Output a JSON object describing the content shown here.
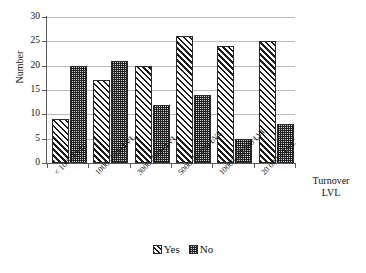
{
  "chart_data": {
    "type": "bar",
    "title": "",
    "subtitle": "",
    "xlabel": "Turnover LVL",
    "xlabel_lines": [
      "Turnover",
      "LVL"
    ],
    "ylabel": "Number",
    "ylim": [
      0,
      30
    ],
    "ytick_step": 5,
    "yticks": [
      0,
      5,
      10,
      15,
      20,
      25,
      30
    ],
    "ytick_labels": [
      "0",
      "5",
      "10",
      "15",
      "20",
      "25",
      "30"
    ],
    "grid": true,
    "grid_axis": "y",
    "legend_position": "bottom",
    "categories": [
      "< 1000 LVL",
      "1000–3000 LVL",
      "3000–5000 LVL",
      "5000–10 000 LVL",
      "10000–20 000 LVL",
      "20 000 < LVL"
    ],
    "series": [
      {
        "name": "Yes",
        "pattern": "diagonal-hatch",
        "values": [
          9,
          17,
          20,
          26,
          24,
          25
        ]
      },
      {
        "name": "No",
        "pattern": "checkerboard",
        "values": [
          20,
          21,
          12,
          14,
          5,
          8
        ]
      }
    ]
  },
  "legend": {
    "items": [
      {
        "label": "Yes",
        "swatch": "diagonal-hatch-swatch"
      },
      {
        "label": "No",
        "swatch": "checkerboard-swatch"
      }
    ]
  },
  "colors": {
    "axis": "#5a5a5a",
    "gridline": "#b9b9b9",
    "bar_outline": "#2a2a2a",
    "yes_fill": "#ffffff",
    "no_fill": "#cfcfcf",
    "text": "#111111",
    "background": "#ffffff"
  }
}
